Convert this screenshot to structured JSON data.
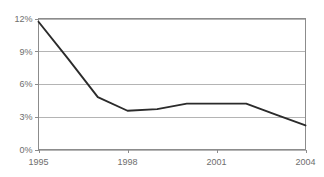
{
  "chart_data": {
    "type": "line",
    "title": "",
    "subtitle": "",
    "xlabel": "",
    "ylabel": "",
    "x": [
      1995,
      1996,
      1997,
      1998,
      1999,
      2000,
      2001,
      2002,
      2003,
      2004
    ],
    "series": [
      {
        "name": "",
        "values": [
          11.7,
          8.3,
          4.8,
          3.55,
          3.7,
          4.2,
          4.2,
          4.2,
          3.2,
          2.2
        ]
      }
    ],
    "xlim": [
      1995,
      2004
    ],
    "ylim": [
      0,
      12
    ],
    "yticks": [
      0,
      3,
      6,
      9,
      12
    ],
    "ytick_labels": [
      "0%",
      "3%",
      "6%",
      "9%",
      "12%"
    ],
    "xticks": [
      1995,
      1998,
      2001,
      2004
    ],
    "xtick_labels": [
      "1995",
      "1998",
      "2001",
      "2004"
    ],
    "grid": true,
    "grid_axis": "y",
    "legend": false,
    "legend_position": "none",
    "colors": {
      "line": "#2b2b2b",
      "grid": "#b4b4b4",
      "frame": "#8c8c8c",
      "text": "#6e6e6e",
      "background": "#ffffff"
    }
  },
  "axis": {
    "y": {
      "labels": [
        {
          "text": "12%",
          "value": 12
        },
        {
          "text": "9%",
          "value": 9
        },
        {
          "text": "6%",
          "value": 6
        },
        {
          "text": "3%",
          "value": 3
        },
        {
          "text": "0%",
          "value": 0
        }
      ]
    },
    "x": {
      "labels": [
        {
          "text": "1995",
          "value": 1995
        },
        {
          "text": "1998",
          "value": 1998
        },
        {
          "text": "2001",
          "value": 2001
        },
        {
          "text": "2004",
          "value": 2004
        }
      ]
    }
  }
}
